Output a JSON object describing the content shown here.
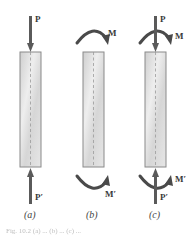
{
  "figure": {
    "panels": [
      {
        "id": "a",
        "subcaption": "(a)",
        "loads": {
          "top_force": "P",
          "bottom_force": "P′"
        }
      },
      {
        "id": "b",
        "subcaption": "(b)",
        "loads": {
          "top_moment": "M",
          "bottom_moment": "M′"
        }
      },
      {
        "id": "c",
        "subcaption": "(c)",
        "loads": {
          "top_force": "P",
          "top_moment": "M",
          "bottom_force": "P′",
          "bottom_moment": "M′"
        }
      }
    ],
    "caption_partial": "Fig. 10.2 (a) ...  (b) ...  (c) ..."
  },
  "colors": {
    "arrow": "#5a5a5a",
    "member_fill": "#dcdcdc",
    "member_border": "#8a8a8a",
    "centerline": "#9a9a9a",
    "label": "#3a3a3a"
  }
}
